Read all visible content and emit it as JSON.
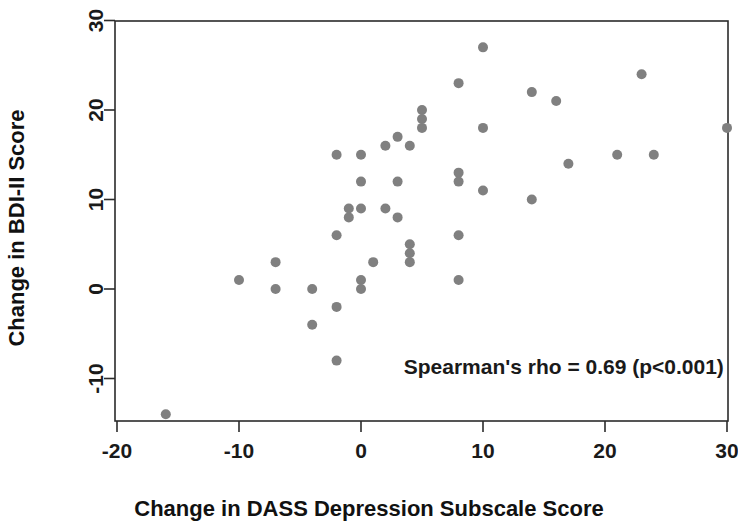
{
  "chart_data": {
    "type": "scatter",
    "title": "",
    "subtitle": "",
    "xlabel": "Change in DASS Depression Subscale Score",
    "ylabel": "Change in BDI-II Score",
    "xlim": [
      -21.5,
      31.5
    ],
    "ylim": [
      -16.5,
      31.5
    ],
    "xticks": [
      -20,
      -10,
      0,
      10,
      20,
      30
    ],
    "xtick_labels": [
      "-20",
      "-10",
      "0",
      "10",
      "20",
      "30"
    ],
    "yticks": [
      -10,
      0,
      10,
      20,
      30
    ],
    "ytick_labels": [
      "-10",
      "0",
      "10",
      "20",
      "30"
    ],
    "grid": false,
    "legend": null,
    "point_color": "#808080",
    "point_radius": 5,
    "annotations": [
      {
        "text": "Spearman's rho = 0.69 (p<0.001)",
        "x": 3.5,
        "y": -9.5,
        "anchor": "start"
      }
    ],
    "series": [
      {
        "name": "participants",
        "points": [
          [
            -16,
            -14
          ],
          [
            -10,
            1
          ],
          [
            -7,
            3
          ],
          [
            -7,
            0
          ],
          [
            -4,
            0
          ],
          [
            -4,
            -4
          ],
          [
            -2,
            15
          ],
          [
            -2,
            6
          ],
          [
            -2,
            -2
          ],
          [
            -2,
            -8
          ],
          [
            -1,
            9
          ],
          [
            -1,
            8
          ],
          [
            0,
            15
          ],
          [
            0,
            12
          ],
          [
            0,
            9
          ],
          [
            0,
            1
          ],
          [
            0,
            0
          ],
          [
            1,
            3
          ],
          [
            2,
            16
          ],
          [
            2,
            9
          ],
          [
            3,
            17
          ],
          [
            3,
            12
          ],
          [
            3,
            8
          ],
          [
            4,
            16
          ],
          [
            4,
            5
          ],
          [
            4,
            4
          ],
          [
            4,
            3
          ],
          [
            5,
            20
          ],
          [
            5,
            19
          ],
          [
            5,
            18
          ],
          [
            8,
            23
          ],
          [
            8,
            13
          ],
          [
            8,
            12
          ],
          [
            8,
            6
          ],
          [
            8,
            1
          ],
          [
            10,
            27
          ],
          [
            10,
            18
          ],
          [
            10,
            11
          ],
          [
            14,
            22
          ],
          [
            14,
            10
          ],
          [
            16,
            21
          ],
          [
            17,
            14
          ],
          [
            21,
            15
          ],
          [
            23,
            24
          ],
          [
            24,
            15
          ],
          [
            30,
            18
          ]
        ]
      }
    ],
    "n_points": 46,
    "statistics": {
      "method": "Spearman's rho",
      "rho": 0.69,
      "p_value_text": "p<0.001"
    }
  },
  "figure": {
    "background_color": "#ffffff",
    "axis_color": "#2b2b2b"
  }
}
